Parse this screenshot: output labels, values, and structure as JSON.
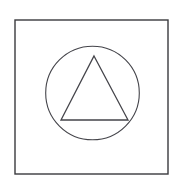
{
  "page": {
    "width": 183,
    "height": 187,
    "background_color": "#ffffff",
    "caption": ""
  },
  "figure": {
    "name": "triangle-in-circle-in-square",
    "stroke_color": "#3a3a3e",
    "fill_color": "none",
    "shapes": [
      {
        "id": "square-frame",
        "type": "rect",
        "label": "Square frame",
        "x": 15,
        "y": 20,
        "width": 153,
        "height": 154,
        "stroke_color": "#3a3a3e",
        "stroke_width": 1.4,
        "fill": "none"
      },
      {
        "id": "inner-circle",
        "type": "circle",
        "label": "Inner circle",
        "cx": 92.5,
        "cy": 93,
        "r": 46.8,
        "stroke_color": "#44444a",
        "stroke_width": 1.1,
        "fill": "none"
      },
      {
        "id": "inner-triangle",
        "type": "polygon",
        "label": "Inner triangle",
        "points": "94,56 128,120 61,120",
        "vertices": [
          {
            "name": "apex",
            "x": 94,
            "y": 56
          },
          {
            "name": "bottom-right",
            "x": 128,
            "y": 120
          },
          {
            "name": "bottom-left",
            "x": 61,
            "y": 120
          }
        ],
        "stroke_color": "#44444a",
        "stroke_width": 1.3,
        "fill": "none"
      }
    ]
  }
}
